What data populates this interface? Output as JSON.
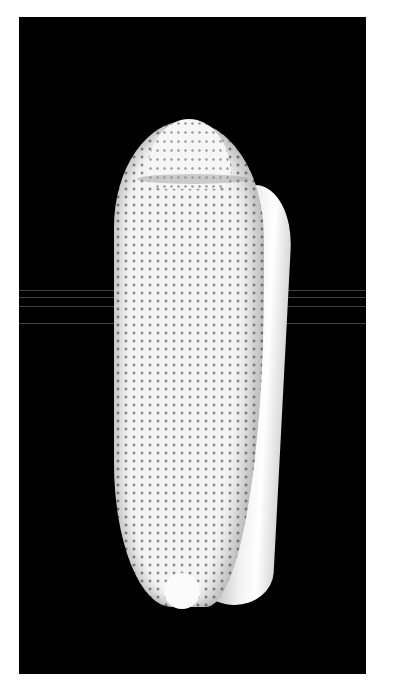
{
  "image": {
    "subject": "olive sea shell specimen",
    "background_color": "#000000",
    "frame_color": "#ffffff",
    "shell_color": "#f4f4f4",
    "dot_color": "#6e6e6e"
  }
}
